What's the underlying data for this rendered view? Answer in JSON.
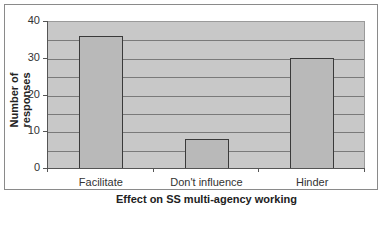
{
  "chart_data": {
    "type": "bar",
    "title": "",
    "categories": [
      "Facilitate",
      "Don't influence",
      "Hinder"
    ],
    "values": [
      36,
      8,
      30
    ],
    "xlabel": "Effect on SS multi-agency working",
    "ylabel": "Number of responses",
    "ylim": [
      0,
      40
    ],
    "yticks": [
      "0",
      "10",
      "20",
      "30",
      "40"
    ],
    "grid": true,
    "grid_step": 5,
    "legend": null,
    "colors": {
      "bar_fill": "#b9b9b9",
      "bar_border": "#3a3a3a",
      "plot_bg": "#c8c8c8",
      "gridline": "#7a7a7a"
    }
  }
}
